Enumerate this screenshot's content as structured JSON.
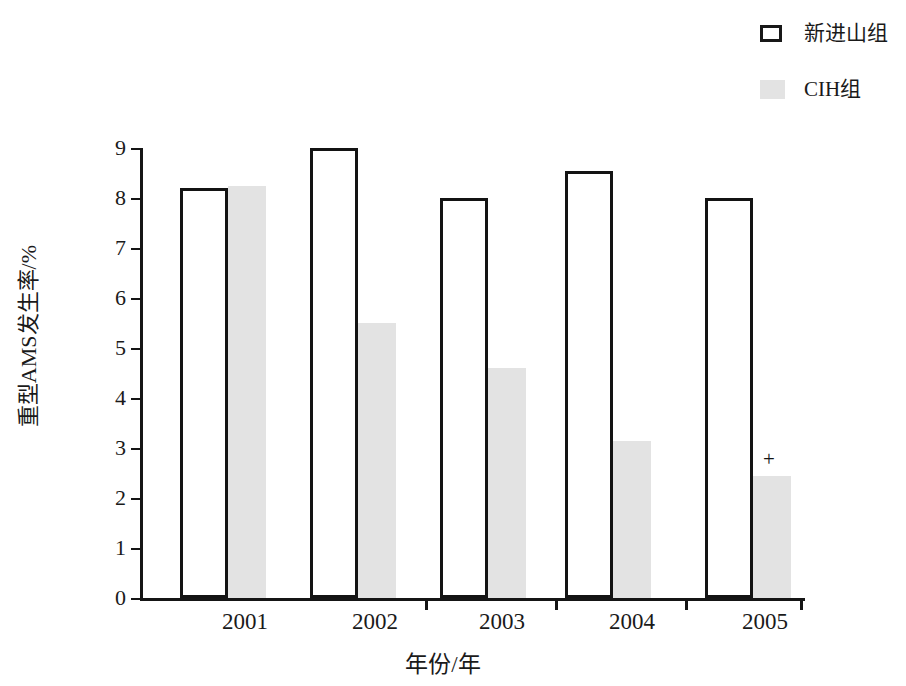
{
  "chart_data": {
    "type": "bar",
    "title": "",
    "xlabel": "年份/年",
    "ylabel": "重型AMS发生率/%",
    "categories": [
      "2001",
      "2002",
      "2003",
      "2004",
      "2005"
    ],
    "ytick_labels": [
      "0",
      "1",
      "2",
      "3",
      "4",
      "5",
      "6",
      "7",
      "8",
      "9"
    ],
    "ylim": [
      0,
      9
    ],
    "grid": false,
    "legend_position": "top-right",
    "series": [
      {
        "name": "新进山组",
        "style": "white-outlined",
        "color": "#ffffff",
        "edge_color": "#131313",
        "values": [
          8.2,
          9.0,
          8.0,
          8.55,
          8.0
        ]
      },
      {
        "name": "CIH组",
        "style": "gray-filled",
        "color": "#e3e3e3",
        "edge_color": "#e3e3e3",
        "values": [
          8.25,
          5.5,
          4.6,
          3.15,
          2.45
        ]
      }
    ],
    "annotations": [
      {
        "text": "+",
        "category": "2005",
        "series": "CIH组",
        "value": 2.45
      }
    ]
  },
  "legend": {
    "items": [
      {
        "label": "新进山组",
        "swatch": "white-box-swatch"
      },
      {
        "label": "CIH组",
        "swatch": "gray-box-swatch"
      }
    ]
  },
  "axes": {
    "y_title": "重型AMS发生率/%",
    "x_title": "年份/年"
  }
}
